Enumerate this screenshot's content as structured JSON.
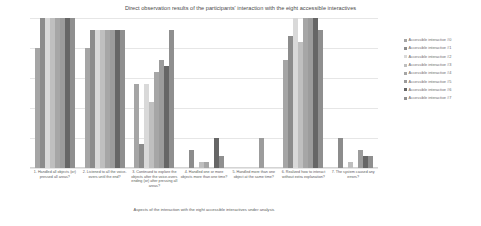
{
  "chart_data": {
    "type": "bar",
    "title": "Direct observation results of the participants' interaction with the eight accessible interactives",
    "xlabel": "Aspects of the interaction with the eight accessible interactives under analysis",
    "ylabel": "",
    "ylim": [
      0,
      25
    ],
    "yticks": [
      "0",
      "5",
      "10",
      "15",
      "20",
      "25"
    ],
    "grid": true,
    "legend_position": "right",
    "categories": [
      "1. Handled all objects (or) pressed all areas?",
      "2. Listened to all the voice-overs until the end?",
      "3. Continued to explore the objects after the voice-overs ending (or) after pressing all areas?",
      "4. Handled one or more objects more than one time?",
      "5. Handled more than one object at the same time?",
      "6. Realized how to interact without extra explanation?",
      "7. The system caused any errors?"
    ],
    "series": [
      {
        "name": "Accessible interactive #0",
        "color": "#a5a5a5",
        "values": [
          20,
          20,
          14,
          0,
          0,
          18,
          0
        ]
      },
      {
        "name": "Accessible interactive #1",
        "color": "#8c8c8c",
        "values": [
          25,
          23,
          4,
          3,
          0,
          22,
          5
        ]
      },
      {
        "name": "Accessible interactive #2",
        "color": "#d9d9d9",
        "values": [
          25,
          23,
          14,
          0,
          0,
          25,
          0
        ]
      },
      {
        "name": "Accessible interactive #3",
        "color": "#bfbfbf",
        "values": [
          25,
          23,
          11,
          1,
          0,
          21,
          1
        ]
      },
      {
        "name": "Accessible interactive #4",
        "color": "#a6a6a6",
        "values": [
          25,
          23,
          16,
          1,
          0,
          25,
          0
        ]
      },
      {
        "name": "Accessible interactive #5",
        "color": "#9c9c9c",
        "values": [
          25,
          23,
          18,
          0,
          5,
          25,
          3
        ]
      },
      {
        "name": "Accessible interactive #6",
        "color": "#666666",
        "values": [
          25,
          23,
          17,
          5,
          0,
          25,
          2
        ]
      },
      {
        "name": "Accessible interactive #7",
        "color": "#8f8f8f",
        "values": [
          25,
          23,
          23,
          2,
          0,
          23,
          2
        ]
      }
    ]
  }
}
